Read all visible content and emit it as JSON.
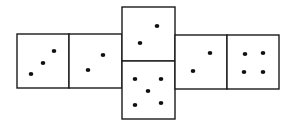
{
  "diagram": {
    "type": "cube-net",
    "faces": [
      {
        "id": "left-outer",
        "pips": 3,
        "x": 17,
        "y": 34,
        "w": 52,
        "h": 54,
        "dots": [
          [
            31,
            74
          ],
          [
            43,
            63
          ],
          [
            54,
            51
          ]
        ]
      },
      {
        "id": "left-inner",
        "pips": 2,
        "x": 69,
        "y": 34,
        "w": 53,
        "h": 54,
        "dots": [
          [
            88,
            70
          ],
          [
            103,
            55
          ]
        ]
      },
      {
        "id": "center-top",
        "pips": 2,
        "x": 122,
        "y": 7,
        "w": 53,
        "h": 54,
        "dots": [
          [
            140,
            43
          ],
          [
            157,
            26
          ]
        ]
      },
      {
        "id": "center-bottom",
        "pips": 5,
        "x": 122,
        "y": 61,
        "w": 53,
        "h": 58,
        "dots": [
          [
            135,
            79
          ],
          [
            161,
            79
          ],
          [
            148,
            91
          ],
          [
            135,
            105
          ],
          [
            161,
            103
          ]
        ]
      },
      {
        "id": "right-inner",
        "pips": 2,
        "x": 175,
        "y": 35,
        "w": 52,
        "h": 54,
        "dots": [
          [
            193,
            71
          ],
          [
            210,
            53
          ]
        ]
      },
      {
        "id": "right-outer",
        "pips": 4,
        "x": 227,
        "y": 35,
        "w": 52,
        "h": 54,
        "dots": [
          [
            245,
            54
          ],
          [
            263,
            53
          ],
          [
            244,
            72
          ],
          [
            263,
            72
          ]
        ]
      }
    ],
    "colors": {
      "line": "#1a1a1a",
      "pip": "#111111",
      "background": "#ffffff"
    }
  }
}
